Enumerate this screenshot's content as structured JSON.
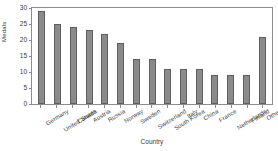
{
  "chart_data": {
    "type": "bar",
    "title": "",
    "xlabel": "Country",
    "ylabel": "Medals",
    "ylim": [
      0,
      30
    ],
    "yticks": [
      0,
      5,
      10,
      15,
      20,
      25,
      30
    ],
    "grid": false,
    "legend": null,
    "bar_color": "#8a8a8a",
    "bar_edge_color": "#5f5f5f",
    "categories": [
      "Germany",
      "United States",
      "Canada",
      "Austria",
      "Russia",
      "Norway",
      "Sweden",
      "Switzerland",
      "South Korea",
      "Italy",
      "China",
      "France",
      "Netherlands",
      "Finland",
      "Other"
    ],
    "values": [
      29,
      25,
      24,
      23,
      22,
      19,
      14,
      14,
      11,
      11,
      11,
      9,
      9,
      9,
      21
    ]
  }
}
